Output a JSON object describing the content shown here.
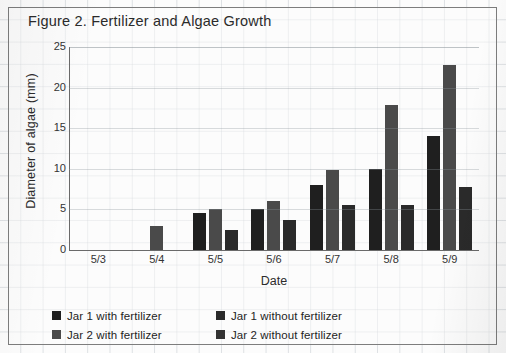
{
  "figure": {
    "title": "Figure 2. Fertilizer and Algae Growth"
  },
  "chart_data": {
    "type": "bar",
    "title": "Figure 2. Fertilizer and Algae Growth",
    "xlabel": "Date",
    "ylabel": "Diameter of algae (mm)",
    "categories": [
      "5/3",
      "5/4",
      "5/5",
      "5/6",
      "5/7",
      "5/8",
      "5/9"
    ],
    "ylim": [
      0,
      25
    ],
    "yticks": [
      0,
      5,
      10,
      15,
      20,
      25
    ],
    "grid": true,
    "legend_position": "bottom",
    "series": [
      {
        "name": "Jar 1 with fertilizer",
        "color": "#1f1f1f",
        "values": [
          0,
          0,
          4.5,
          5.0,
          8.0,
          10.0,
          14.0
        ]
      },
      {
        "name": "Jar 2 with fertilizer",
        "color": "#4a4a4a",
        "values": [
          0,
          3.0,
          5.0,
          6.0,
          9.8,
          17.8,
          22.8
        ]
      },
      {
        "name": "Jar 1 without fertilizer",
        "color": "#2a2a2a",
        "values": [
          0,
          0,
          2.5,
          3.7,
          5.6,
          5.6,
          7.8
        ]
      },
      {
        "name": "Jar 2 without fertilizer",
        "color": "#333333",
        "values": [
          0,
          0,
          0,
          0,
          0,
          0,
          0
        ]
      }
    ]
  },
  "legend": {
    "entries": [
      {
        "label": "Jar 1 with fertilizer",
        "color": "#1f1f1f"
      },
      {
        "label": "Jar 1 without fertilizer",
        "color": "#2a2a2a"
      },
      {
        "label": "Jar 2 with fertilizer",
        "color": "#4a4a4a"
      },
      {
        "label": "Jar 2 without fertilizer",
        "color": "#333333"
      }
    ]
  }
}
